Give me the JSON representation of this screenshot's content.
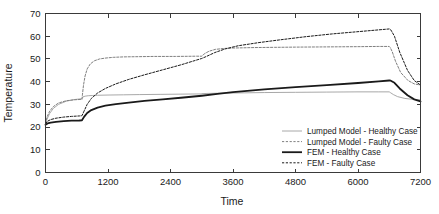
{
  "chart_data": {
    "type": "line",
    "title": "",
    "xlabel": "Time",
    "ylabel": "Temperature",
    "xlim": [
      0,
      7200
    ],
    "ylim": [
      0,
      70
    ],
    "xticks": [
      0,
      1200,
      2400,
      3600,
      4800,
      6000,
      7200
    ],
    "yticks": [
      0,
      10,
      20,
      30,
      40,
      50,
      60,
      70
    ],
    "xtick_labels": [
      "0",
      "1200",
      "2400",
      "3600",
      "4800",
      "6000",
      "7200"
    ],
    "ytick_labels": [
      "0",
      "10",
      "20",
      "30",
      "40",
      "50",
      "60",
      "70"
    ],
    "grid": false,
    "legend_position": "lower right",
    "series": [
      {
        "name": "Lumped Model - Healthy Case",
        "style": "solid",
        "color": "#9e9e9e",
        "width": 0.9,
        "x": [
          0,
          30,
          80,
          150,
          250,
          400,
          550,
          700,
          720,
          760,
          820,
          900,
          1000,
          1200,
          1500,
          1800,
          2200,
          2600,
          3000,
          3000,
          3100,
          3300,
          3600,
          4200,
          4800,
          5400,
          6000,
          6400,
          6600,
          6620,
          6680,
          6760,
          6900,
          7050,
          7200
        ],
        "y": [
          21.0,
          23.5,
          26.0,
          28.2,
          30.0,
          31.4,
          32.1,
          32.5,
          33.3,
          33.6,
          33.8,
          33.9,
          34.0,
          34.1,
          34.2,
          34.3,
          34.4,
          34.5,
          34.6,
          34.7,
          34.8,
          34.9,
          35.0,
          35.2,
          35.3,
          35.4,
          35.5,
          35.5,
          35.5,
          35.2,
          34.3,
          33.4,
          32.6,
          32.2,
          32.0
        ]
      },
      {
        "name": "Lumped Model - Faulty Case",
        "style": "dashed",
        "color": "#808080",
        "width": 1.0,
        "x": [
          0,
          30,
          80,
          150,
          250,
          400,
          550,
          700,
          710,
          730,
          760,
          800,
          860,
          940,
          1040,
          1160,
          1300,
          1500,
          1800,
          2100,
          2500,
          2900,
          3000,
          3000,
          3060,
          3140,
          3260,
          3420,
          3600,
          4000,
          4400,
          4800,
          5400,
          6000,
          6400,
          6600,
          6620,
          6660,
          6720,
          6820,
          6960,
          7080,
          7200
        ],
        "y": [
          21.5,
          24.5,
          27.0,
          29.0,
          30.6,
          31.6,
          32.0,
          32.2,
          34.5,
          38.5,
          42.5,
          45.6,
          47.8,
          49.2,
          50.0,
          50.4,
          50.7,
          50.9,
          51.0,
          51.1,
          51.1,
          51.2,
          51.2,
          51.3,
          52.4,
          53.4,
          54.2,
          54.6,
          54.8,
          55.0,
          55.1,
          55.2,
          55.3,
          55.4,
          55.5,
          55.5,
          55.0,
          53.0,
          49.0,
          44.0,
          40.5,
          39.0,
          38.5
        ]
      },
      {
        "name": "FEM - Healthy Case",
        "style": "solid",
        "color": "#1a1a1a",
        "width": 1.8,
        "x": [
          0,
          40,
          100,
          200,
          350,
          500,
          650,
          700,
          740,
          800,
          880,
          1000,
          1150,
          1350,
          1600,
          1900,
          2250,
          2600,
          3000,
          3300,
          3600,
          4200,
          4800,
          5400,
          6000,
          6400,
          6600,
          6630,
          6700,
          6800,
          6950,
          7080,
          7200
        ],
        "y": [
          21.0,
          21.6,
          22.0,
          22.3,
          22.6,
          22.8,
          22.9,
          23.0,
          24.5,
          26.2,
          27.5,
          28.6,
          29.4,
          30.1,
          30.8,
          31.5,
          32.2,
          32.9,
          33.8,
          34.6,
          35.4,
          36.6,
          37.6,
          38.5,
          39.4,
          40.1,
          40.5,
          40.4,
          39.5,
          37.0,
          34.0,
          32.2,
          31.3
        ]
      },
      {
        "name": "FEM - Faulty Case",
        "style": "dashed",
        "color": "#1a1a1a",
        "width": 1.0,
        "x": [
          0,
          40,
          100,
          200,
          350,
          500,
          650,
          700,
          740,
          800,
          880,
          1000,
          1150,
          1350,
          1600,
          1900,
          2250,
          2600,
          3000,
          3100,
          3250,
          3450,
          3700,
          4100,
          4500,
          5000,
          5500,
          6000,
          6400,
          6600,
          6630,
          6700,
          6800,
          6950,
          7080,
          7200
        ],
        "y": [
          21.5,
          22.6,
          23.3,
          23.9,
          24.4,
          24.7,
          24.9,
          25.0,
          27.0,
          30.0,
          32.6,
          35.0,
          37.0,
          39.0,
          41.0,
          43.0,
          45.2,
          47.4,
          50.2,
          51.2,
          52.8,
          54.4,
          55.8,
          57.2,
          58.4,
          59.8,
          61.0,
          62.0,
          62.8,
          63.2,
          62.8,
          60.0,
          53.0,
          45.0,
          40.5,
          38.5
        ]
      }
    ]
  },
  "legend": {
    "items": [
      {
        "label": "Lumped Model - Healthy Case",
        "style": "solid",
        "color": "#9e9e9e",
        "width": 0.9
      },
      {
        "label": "Lumped Model - Faulty Case",
        "style": "dashed",
        "color": "#808080",
        "width": 1.0
      },
      {
        "label": "FEM - Healthy Case",
        "style": "solid",
        "color": "#1a1a1a",
        "width": 1.8
      },
      {
        "label": "FEM - Faulty Case",
        "style": "dashed",
        "color": "#1a1a1a",
        "width": 1.0
      }
    ]
  }
}
